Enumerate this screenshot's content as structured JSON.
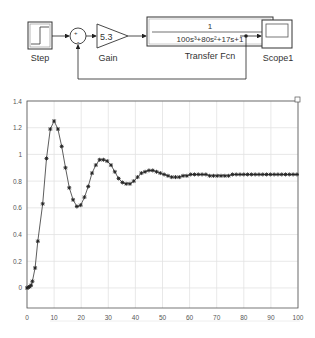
{
  "diagram": {
    "blocks": {
      "step": {
        "label": "Step"
      },
      "sum": {
        "signs": "+-",
        "minus_label": "-"
      },
      "gain": {
        "label": "Gain",
        "value": "5.3"
      },
      "transfer_fcn": {
        "label": "Transfer Fcn",
        "numerator": "1",
        "denominator": "100s³+80s²+17s+1"
      },
      "scope": {
        "label": "Scope1"
      }
    },
    "colors": {
      "line": "#222222",
      "block_border": "#333333"
    }
  },
  "chart_data": {
    "type": "line",
    "title": "",
    "xlabel": "",
    "ylabel": "",
    "xlim": [
      0,
      100
    ],
    "ylim": [
      -0.15,
      1.4
    ],
    "grid": true,
    "legend": null,
    "marker": "*",
    "xticks": [
      0,
      10,
      20,
      30,
      40,
      50,
      60,
      70,
      80,
      90,
      100
    ],
    "yticks": [
      0,
      0.2,
      0.4,
      0.6,
      0.8,
      1,
      1.2,
      1.4
    ],
    "xtick_labels": [
      "0",
      "10",
      "20",
      "30",
      "40",
      "50",
      "60",
      "70",
      "80",
      "90",
      "100"
    ],
    "ytick_labels": [
      "0",
      "0.2",
      "0.4",
      "0.6",
      "0.8",
      "1",
      "1.2",
      "1.4"
    ],
    "series": [
      {
        "name": "step response",
        "color": "#333333",
        "x": [
          0,
          0.5,
          1,
          1.5,
          2,
          3,
          4,
          5.8,
          7.2,
          8.6,
          10,
          11.4,
          12.8,
          14.2,
          15.6,
          17,
          18.4,
          19.8,
          21.2,
          22.6,
          24,
          25.4,
          26.8,
          28.2,
          29.6,
          31,
          32.4,
          33.8,
          35.2,
          36.6,
          38,
          39.4,
          40.8,
          42.2,
          43.6,
          45,
          46.4,
          47.8,
          49.2,
          50.6,
          52,
          53.4,
          54.8,
          56.2,
          57.6,
          59,
          60.4,
          61.8,
          63.2,
          64.6,
          66,
          67.4,
          68.8,
          70.2,
          71.6,
          73,
          74.4,
          75.8,
          77.2,
          78.6,
          80,
          81.4,
          82.8,
          84.2,
          85.6,
          87,
          88.4,
          89.8,
          91.2,
          92.6,
          94,
          95.4,
          96.8,
          98.2,
          99.6
        ],
        "y": [
          0,
          0.005,
          0.01,
          0.02,
          0.05,
          0.15,
          0.35,
          0.63,
          0.97,
          1.19,
          1.25,
          1.19,
          1.06,
          0.9,
          0.75,
          0.66,
          0.61,
          0.62,
          0.68,
          0.76,
          0.86,
          0.92,
          0.96,
          0.96,
          0.95,
          0.92,
          0.87,
          0.82,
          0.79,
          0.78,
          0.78,
          0.8,
          0.83,
          0.86,
          0.87,
          0.88,
          0.88,
          0.87,
          0.86,
          0.85,
          0.84,
          0.83,
          0.83,
          0.83,
          0.84,
          0.84,
          0.85,
          0.85,
          0.85,
          0.85,
          0.85,
          0.84,
          0.84,
          0.84,
          0.84,
          0.84,
          0.84,
          0.85,
          0.85,
          0.85,
          0.85,
          0.85,
          0.85,
          0.85,
          0.85,
          0.85,
          0.85,
          0.85,
          0.85,
          0.85,
          0.85,
          0.85,
          0.85,
          0.85,
          0.85
        ]
      }
    ]
  }
}
